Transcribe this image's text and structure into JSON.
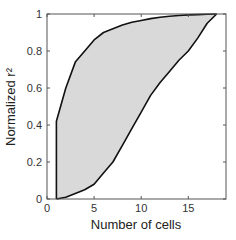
{
  "chart_data": {
    "type": "area",
    "title": "",
    "xlabel": "Number of cells",
    "ylabel": "Normalized r²",
    "xlim": [
      0,
      19
    ],
    "ylim": [
      0,
      1
    ],
    "grid": false,
    "legend": null,
    "xticks": [
      0,
      5,
      10,
      15
    ],
    "xtick_labels": [
      "0",
      "5",
      "10",
      "15"
    ],
    "yticks": [
      0,
      0.2,
      0.4,
      0.6,
      0.8,
      1
    ],
    "ytick_labels": [
      "0",
      "0.2",
      "0.4",
      "0.6",
      "0.8",
      "1"
    ],
    "fill_color": "#d9d9d9",
    "line_color": "#111111",
    "series": [
      {
        "name": "upper bound",
        "x": [
          1,
          1,
          2,
          3,
          4,
          5,
          6,
          7,
          8,
          9,
          10,
          11,
          12,
          13,
          14,
          15,
          16,
          17,
          18
        ],
        "y": [
          0,
          0.42,
          0.6,
          0.74,
          0.8,
          0.86,
          0.9,
          0.92,
          0.94,
          0.955,
          0.965,
          0.975,
          0.982,
          0.988,
          0.992,
          0.995,
          0.997,
          0.999,
          1.0
        ]
      },
      {
        "name": "lower bound",
        "x": [
          1,
          2,
          3,
          4,
          5,
          6,
          7,
          8,
          9,
          10,
          11,
          12,
          13,
          14,
          15,
          16,
          17,
          18
        ],
        "y": [
          0,
          0.01,
          0.03,
          0.05,
          0.08,
          0.14,
          0.2,
          0.29,
          0.38,
          0.47,
          0.56,
          0.63,
          0.69,
          0.75,
          0.8,
          0.87,
          0.95,
          1.0
        ]
      }
    ]
  }
}
